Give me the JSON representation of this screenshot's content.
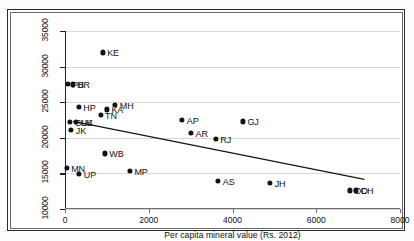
{
  "chart_data": {
    "type": "scatter",
    "title": "",
    "xlabel": "Per capita mineral value (Rs. 2012)",
    "ylabel": "",
    "xlim": [
      0,
      8000
    ],
    "ylim": [
      10000,
      35000
    ],
    "xticks": [
      "0",
      "2000",
      "4000",
      "6000",
      "8000"
    ],
    "xtick_values": [
      0,
      2000,
      4000,
      6000,
      8000
    ],
    "yticks": [
      "10000",
      "15000",
      "20000",
      "25000",
      "30000",
      "35000"
    ],
    "ytick_values": [
      10000,
      15000,
      20000,
      25000,
      30000,
      35000
    ],
    "grid": "horizontal",
    "legend": "none",
    "points": [
      {
        "label": "KE",
        "x": 900,
        "y": 32000,
        "label_pos": "right"
      },
      {
        "label": "PB",
        "x": 60,
        "y": 27550,
        "label_pos": "right"
      },
      {
        "label": "HR",
        "x": 180,
        "y": 27500,
        "label_pos": "right"
      },
      {
        "label": "HP",
        "x": 330,
        "y": 24350,
        "label_pos": "right"
      },
      {
        "label": "MH",
        "x": 1200,
        "y": 24600,
        "label_pos": "right"
      },
      {
        "label": "KA",
        "x": 1000,
        "y": 24000,
        "label_pos": "right"
      },
      {
        "label": "TN",
        "x": 850,
        "y": 23200,
        "label_pos": "right"
      },
      {
        "label": "GUJ",
        "x": 120,
        "y": 22250,
        "label_pos": "right"
      },
      {
        "label": "UK",
        "x": 260,
        "y": 22200,
        "label_pos": "right"
      },
      {
        "label": "JK",
        "x": 150,
        "y": 21150,
        "label_pos": "right"
      },
      {
        "label": "AP",
        "x": 2800,
        "y": 22500,
        "label_pos": "right"
      },
      {
        "label": "GJ",
        "x": 4250,
        "y": 22300,
        "label_pos": "right"
      },
      {
        "label": "AR",
        "x": 3010,
        "y": 20700,
        "label_pos": "right"
      },
      {
        "label": "RJ",
        "x": 3600,
        "y": 19800,
        "label_pos": "right"
      },
      {
        "label": "WB",
        "x": 950,
        "y": 17800,
        "label_pos": "right"
      },
      {
        "label": "MN",
        "x": 40,
        "y": 15800,
        "label_pos": "right"
      },
      {
        "label": "UP",
        "x": 340,
        "y": 14950,
        "label_pos": "right"
      },
      {
        "label": "MP",
        "x": 1550,
        "y": 15400,
        "label_pos": "right"
      },
      {
        "label": "AS",
        "x": 3660,
        "y": 14000,
        "label_pos": "right"
      },
      {
        "label": "JH",
        "x": 4900,
        "y": 13700,
        "label_pos": "right"
      },
      {
        "label": "OD",
        "x": 6800,
        "y": 12600,
        "label_pos": "right"
      },
      {
        "label": "CH",
        "x": 6950,
        "y": 12600,
        "label_pos": "right"
      }
    ],
    "trendline": {
      "type": "linear-fit",
      "x_start": 200,
      "y_start": 22300,
      "x_end": 7150,
      "y_end": 14150,
      "color": "#151515"
    }
  },
  "colors": {
    "point": "#121212",
    "grid": "#d8d8d8",
    "axis": "#222222",
    "frame": "#2a2a2a",
    "background": "#ffffff"
  }
}
